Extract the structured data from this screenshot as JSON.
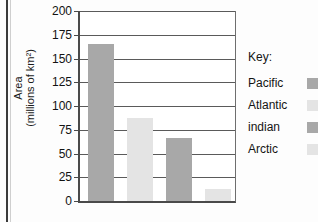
{
  "chart_data": {
    "type": "bar",
    "title": "",
    "xlabel": "",
    "ylabel_line1": "Area",
    "ylabel_line2": "(millions of km²)",
    "categories": [
      "Pacific",
      "Atlantic",
      "indian",
      "Arctic"
    ],
    "values": [
      165,
      87,
      66,
      13
    ],
    "ylim": [
      0,
      200
    ],
    "yticks": [
      200,
      175,
      150,
      125,
      100,
      75,
      50,
      25,
      0
    ],
    "grid": true,
    "legend_position": "right",
    "series_colors": [
      "#a8a8a8",
      "#e4e4e4",
      "#a8a8a8",
      "#e4e4e4"
    ]
  },
  "legend": {
    "title": "Key:",
    "entries": [
      {
        "label": "Pacific",
        "swatch": "dark"
      },
      {
        "label": "Atlantic",
        "swatch": "light"
      },
      {
        "label": "indian",
        "swatch": "dark"
      },
      {
        "label": "Arctic",
        "swatch": "light"
      }
    ]
  }
}
